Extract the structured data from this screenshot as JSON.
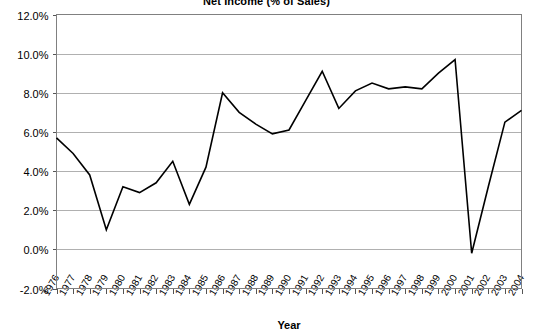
{
  "chart_data": {
    "type": "line",
    "title": "Net Income (% of Sales)",
    "xlabel": "Year",
    "ylabel": "",
    "ylim": [
      -2.0,
      12.0
    ],
    "ytick_step": 2.0,
    "yticks": [
      "12.0%",
      "10.0%",
      "8.0%",
      "6.0%",
      "4.0%",
      "2.0%",
      "0.0%",
      "-2.0%"
    ],
    "ytick_values": [
      12.0,
      10.0,
      8.0,
      6.0,
      4.0,
      2.0,
      0.0,
      -2.0
    ],
    "grid": true,
    "legend": "none",
    "categories": [
      "1976",
      "1977",
      "1978",
      "1979",
      "1980",
      "1981",
      "1982",
      "1983",
      "1984",
      "1985",
      "1986",
      "1987",
      "1988",
      "1989",
      "1990",
      "1991",
      "1992",
      "1993",
      "1994",
      "1995",
      "1996",
      "1997",
      "1998",
      "1999",
      "2000",
      "2001",
      "2002",
      "2003",
      "2004"
    ],
    "values": [
      5.7,
      4.9,
      3.8,
      1.0,
      3.2,
      2.9,
      3.4,
      4.5,
      2.3,
      4.2,
      8.0,
      7.0,
      6.4,
      5.9,
      6.1,
      7.6,
      9.1,
      7.2,
      8.1,
      8.5,
      8.2,
      8.3,
      8.2,
      9.0,
      9.7,
      -0.2,
      3.2,
      6.5,
      7.1
    ],
    "series_color": "#000000",
    "grid_color": "#b0b0b0",
    "frame_color": "#808080"
  }
}
